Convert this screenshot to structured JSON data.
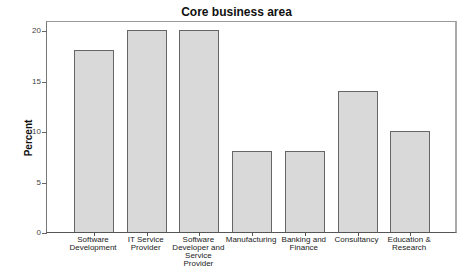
{
  "chart_data": {
    "type": "bar",
    "title": "Core business area",
    "xlabel": "",
    "ylabel": "Percent",
    "categories": [
      "Software\nDevelopment",
      "IT Service\nProvider",
      "Software\nDeveloper and\nService\nProvider",
      "Manufacturing",
      "Banking and\nFinance",
      "Consultancy",
      "Education &\nResearch"
    ],
    "values": [
      18,
      20,
      20,
      8,
      8,
      14,
      10
    ],
    "ylim": [
      0,
      21
    ],
    "yticks": [
      0,
      5,
      10,
      15,
      20
    ],
    "grid": false,
    "legend": null,
    "bar_color": "#d9d9d9",
    "bar_edge_color": "#666666"
  }
}
